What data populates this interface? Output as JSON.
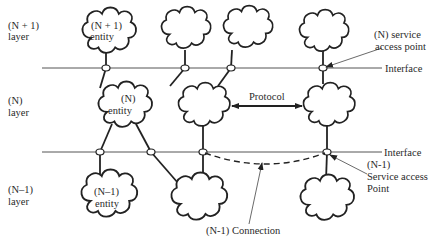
{
  "layers": {
    "n_plus_1": {
      "line1": "(N + 1)",
      "line2": "layer"
    },
    "n": {
      "line1": "(N)",
      "line2": "layer"
    },
    "n_minus_1": {
      "line1": "(N–1)",
      "line2": "layer"
    }
  },
  "entities": {
    "n_plus_1": {
      "line1": "(N + 1)",
      "line2": "entity"
    },
    "n": {
      "line1": "(N)",
      "line2": "entity"
    },
    "n_minus_1": {
      "line1": "(N–1)",
      "line2": "entity"
    }
  },
  "labels": {
    "protocol": "Protocol",
    "interface_top": "Interface",
    "interface_bottom": "Interface",
    "n_sap_line1": "(N) service",
    "n_sap_line2": "access point",
    "n_minus_1_sap_line1": "(N-1)",
    "n_minus_1_sap_line2": "Service access",
    "n_minus_1_sap_line3": "Point",
    "connection": "(N-1)  Connection"
  },
  "colors": {
    "line": "#222222",
    "background": "#ffffff"
  }
}
